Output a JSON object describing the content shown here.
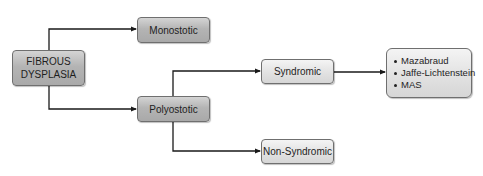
{
  "diagram": {
    "root": {
      "line1": "FIBROUS",
      "line2": "DYSPLASIA"
    },
    "nodes": {
      "monostotic": "Monostotic",
      "polyostotic": "Polyostotic",
      "syndromic": "Syndromic",
      "non_syndromic": "Non-Syndromic"
    },
    "syndromes": [
      "Mazabraud",
      "Jaffe-Lichtenstein",
      "MAS"
    ],
    "edges": [
      {
        "from": "FIBROUS DYSPLASIA",
        "to": "Monostotic"
      },
      {
        "from": "FIBROUS DYSPLASIA",
        "to": "Polyostotic"
      },
      {
        "from": "Polyostotic",
        "to": "Syndromic"
      },
      {
        "from": "Polyostotic",
        "to": "Non-Syndromic"
      },
      {
        "from": "Syndromic",
        "to": "Mazabraud / Jaffe-Lichtenstein / MAS"
      }
    ],
    "colors": {
      "dark_box": "#b4b4b4",
      "light_box": "#e2e2e2",
      "border": "#6f6f6f",
      "line": "#1a1a1a",
      "text": "#1e1e1e"
    }
  }
}
